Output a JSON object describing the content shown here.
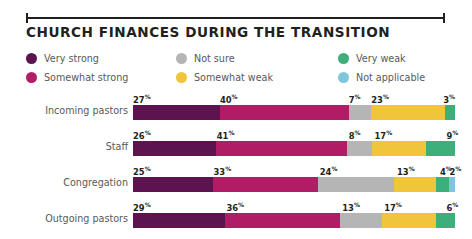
{
  "title": "CHURCH FINANCES DURING THE TRANSITION",
  "legend": [
    [
      {
        "label": "Very strong",
        "color": "#5C1450",
        "key": "very_strong"
      },
      {
        "label": "Not sure",
        "color": "#B5B5B5",
        "key": "not_sure"
      },
      {
        "label": "Very weak",
        "color": "#3CAF7A",
        "key": "very_weak"
      }
    ],
    [
      {
        "label": "Somewhat strong",
        "color": "#B01D66",
        "key": "somewhat_strong"
      },
      {
        "label": "Somewhat weak",
        "color": "#F0C53C",
        "key": "somewhat_weak"
      },
      {
        "label": "Not applicable",
        "color": "#7FC6DC",
        "key": "not_applicable"
      }
    ]
  ],
  "chart_data": {
    "type": "bar",
    "title": "CHURCH FINANCES DURING THE TRANSITION",
    "xlabel": "",
    "ylabel": "",
    "stacked": true,
    "orientation": "horizontal",
    "unit": "%",
    "xlim": [
      0,
      100
    ],
    "grid": false,
    "legend_position": "top",
    "categories": [
      "Incoming pastors",
      "Staff",
      "Congregation",
      "Outgoing pastors"
    ],
    "series": [
      {
        "name": "Very strong",
        "color": "#5C1450",
        "values": [
          27,
          26,
          25,
          29
        ]
      },
      {
        "name": "Somewhat strong",
        "color": "#B01D66",
        "values": [
          40,
          41,
          33,
          36
        ]
      },
      {
        "name": "Not sure",
        "color": "#B5B5B5",
        "values": [
          7,
          8,
          24,
          13
        ]
      },
      {
        "name": "Somewhat weak",
        "color": "#F0C53C",
        "values": [
          23,
          17,
          13,
          17
        ]
      },
      {
        "name": "Very weak",
        "color": "#3CAF7A",
        "values": [
          3,
          9,
          4,
          6
        ]
      },
      {
        "name": "Not applicable",
        "color": "#7FC6DC",
        "values": [
          0,
          0,
          2,
          0
        ]
      }
    ],
    "rows": [
      {
        "label": "Incoming pastors",
        "segments": [
          {
            "name": "Very strong",
            "value": 27,
            "label": "27",
            "color": "#5C1450"
          },
          {
            "name": "Somewhat strong",
            "value": 40,
            "label": "40",
            "color": "#B01D66"
          },
          {
            "name": "Not sure",
            "value": 7,
            "label": "7",
            "color": "#B5B5B5"
          },
          {
            "name": "Somewhat weak",
            "value": 23,
            "label": "23",
            "color": "#F0C53C"
          },
          {
            "name": "Very weak",
            "value": 3,
            "label": "3",
            "color": "#3CAF7A"
          }
        ]
      },
      {
        "label": "Staff",
        "segments": [
          {
            "name": "Very strong",
            "value": 26,
            "label": "26",
            "color": "#5C1450"
          },
          {
            "name": "Somewhat strong",
            "value": 41,
            "label": "41",
            "color": "#B01D66"
          },
          {
            "name": "Not sure",
            "value": 8,
            "label": "8",
            "color": "#B5B5B5"
          },
          {
            "name": "Somewhat weak",
            "value": 17,
            "label": "17",
            "color": "#F0C53C"
          },
          {
            "name": "Very weak",
            "value": 9,
            "label": "9",
            "color": "#3CAF7A"
          }
        ]
      },
      {
        "label": "Congregation",
        "segments": [
          {
            "name": "Very strong",
            "value": 25,
            "label": "25",
            "color": "#5C1450"
          },
          {
            "name": "Somewhat strong",
            "value": 33,
            "label": "33",
            "color": "#B01D66"
          },
          {
            "name": "Not sure",
            "value": 24,
            "label": "24",
            "color": "#B5B5B5"
          },
          {
            "name": "Somewhat weak",
            "value": 13,
            "label": "13",
            "color": "#F0C53C"
          },
          {
            "name": "Very weak",
            "value": 4,
            "label": "4",
            "color": "#3CAF7A"
          },
          {
            "name": "Not applicable",
            "value": 2,
            "label": "2",
            "color": "#7FC6DC"
          }
        ]
      },
      {
        "label": "Outgoing pastors",
        "segments": [
          {
            "name": "Very strong",
            "value": 29,
            "label": "29",
            "color": "#5C1450"
          },
          {
            "name": "Somewhat strong",
            "value": 36,
            "label": "36",
            "color": "#B01D66"
          },
          {
            "name": "Not sure",
            "value": 13,
            "label": "13",
            "color": "#B5B5B5"
          },
          {
            "name": "Somewhat weak",
            "value": 17,
            "label": "17",
            "color": "#F0C53C"
          },
          {
            "name": "Very weak",
            "value": 6,
            "label": "6",
            "color": "#3CAF7A"
          }
        ]
      }
    ]
  }
}
